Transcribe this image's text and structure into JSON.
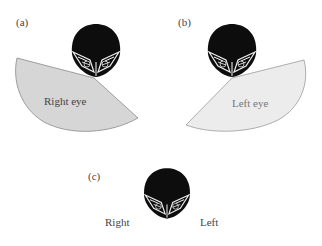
{
  "panels": [
    {
      "id": "a",
      "label": "(a)",
      "field_label": "Right eye",
      "field_color": "#d6d6d6"
    },
    {
      "id": "b",
      "label": "(b)",
      "field_label": "Left eye",
      "field_color": "#ececec"
    },
    {
      "id": "c",
      "label": "(c)",
      "left_text": "Right",
      "right_text": "Left"
    }
  ],
  "colors": {
    "outline": "#8a8a8a",
    "owl_head": "#0d0d0d"
  }
}
